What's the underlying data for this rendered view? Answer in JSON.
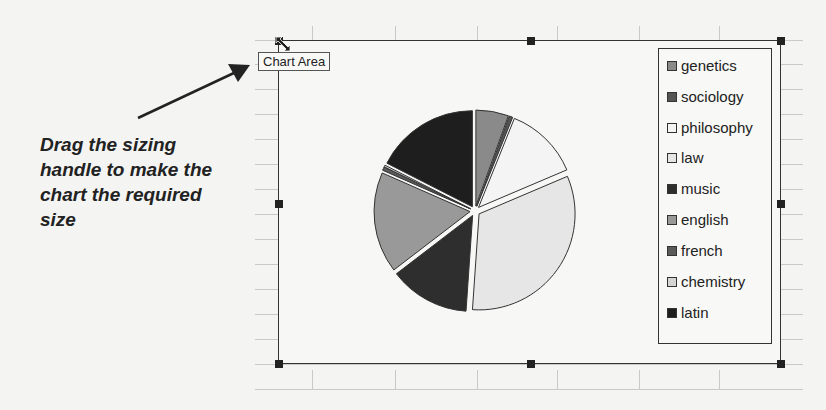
{
  "callout": {
    "lines": [
      "Drag the sizing",
      "handle to make the",
      "chart the required",
      "size"
    ]
  },
  "tooltip": {
    "label": "Chart Area"
  },
  "icons": {
    "resize": "diagonal-resize-cursor-icon",
    "arrow": "callout-arrow-icon"
  },
  "legend": {
    "items": [
      {
        "label": "genetics",
        "color": "#8a8a8a"
      },
      {
        "label": "sociology",
        "color": "#555555"
      },
      {
        "label": "philosophy",
        "color": "#f4f4f4"
      },
      {
        "label": "law",
        "color": "#e6e6e6"
      },
      {
        "label": "music",
        "color": "#2e2e2e"
      },
      {
        "label": "english",
        "color": "#999999"
      },
      {
        "label": "french",
        "color": "#5a5a5a"
      },
      {
        "label": "chemistry",
        "color": "#d4d4d4"
      },
      {
        "label": "latin",
        "color": "#1e1e1e"
      }
    ]
  },
  "chart_data": {
    "type": "pie",
    "title": "",
    "categories": [
      "genetics",
      "sociology",
      "philosophy",
      "law",
      "music",
      "english",
      "french",
      "chemistry",
      "latin"
    ],
    "values": [
      5.5,
      0.6,
      12.5,
      32.5,
      13.5,
      17.0,
      0.6,
      0.3,
      17.5
    ],
    "exploded": true,
    "legend_position": "right",
    "colors": [
      "#8a8a8a",
      "#555555",
      "#f4f4f4",
      "#e6e6e6",
      "#2e2e2e",
      "#999999",
      "#5a5a5a",
      "#d4d4d4",
      "#1e1e1e"
    ]
  }
}
